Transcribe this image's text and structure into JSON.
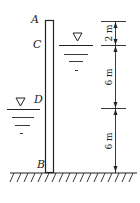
{
  "diagram": {
    "type": "retaining-wall-water-pressure",
    "labels": {
      "A": "A",
      "B": "B",
      "C": "C",
      "D": "D"
    },
    "dimensions": [
      {
        "id": "AC",
        "text": "2 m"
      },
      {
        "id": "CD",
        "text": "6 m"
      },
      {
        "id": "DB",
        "text": "6 m"
      }
    ],
    "water_levels": [
      {
        "side": "right",
        "at": "C",
        "symbol": "▽"
      },
      {
        "side": "left",
        "at": "D",
        "symbol": "▽"
      }
    ],
    "colors": {
      "line": "#222222",
      "background": "#ffffff"
    }
  }
}
